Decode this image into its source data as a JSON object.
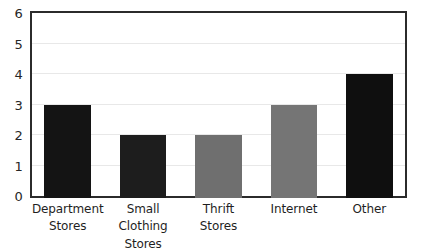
{
  "chart_data": {
    "type": "bar",
    "title": "",
    "subtitle": "",
    "xlabel": "",
    "ylabel": "",
    "categories": [
      "Department Stores",
      "Small Clothing Stores",
      "Thrift Stores",
      "Internet",
      "Other"
    ],
    "category_lines": [
      [
        "Department",
        "Stores"
      ],
      [
        "Small Clothing",
        "Stores"
      ],
      [
        "Thrift",
        "Stores"
      ],
      [
        "Internet",
        ""
      ],
      [
        "Other",
        ""
      ]
    ],
    "values": [
      3,
      2,
      2,
      3,
      4
    ],
    "bar_colors": [
      "#141414",
      "#1d1d1d",
      "#6f6f6f",
      "#757575",
      "#0f0f0f"
    ],
    "ylim": [
      0,
      6
    ],
    "y_ticks": [
      0,
      1,
      2,
      3,
      4,
      5,
      6
    ],
    "y_tick_labels": [
      "0",
      "1",
      "2",
      "3",
      "4",
      "5",
      "6"
    ],
    "grid": true,
    "legend": false,
    "legend_position": "none",
    "annotations": []
  },
  "style": {
    "background": "#ffffff",
    "frame_color": "#2b2b2b",
    "grid_color": "#e8e8e8",
    "tick_label_color": "#262626",
    "category_label_color": "#1f1f1f"
  }
}
